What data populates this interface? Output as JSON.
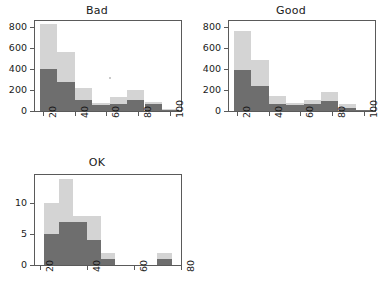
{
  "figure": {
    "background": "#ffffff",
    "colors": {
      "light_series": "#d4d4d4",
      "dark_series": "#6e6e6e",
      "axis": "#5a5a5a",
      "text": "#1a1a1a"
    },
    "layout": "2x2 grid, bottom-right cell empty"
  },
  "chart_data": [
    {
      "type": "bar",
      "title": "Bad",
      "xlabel": "",
      "ylabel": "",
      "xlim": [
        15,
        107
      ],
      "ylim": [
        0,
        860
      ],
      "grid": false,
      "legend": null,
      "xticks": [
        20,
        40,
        60,
        80,
        100
      ],
      "yticks": [
        0,
        200,
        400,
        600,
        800
      ],
      "bin_edges": [
        18,
        29,
        40,
        51,
        62,
        73,
        84,
        95,
        106
      ],
      "series": [
        {
          "name": "light",
          "values": [
            830,
            560,
            220,
            80,
            130,
            205,
            85,
            15
          ]
        },
        {
          "name": "dark",
          "values": [
            405,
            275,
            110,
            55,
            65,
            105,
            70,
            8
          ]
        }
      ],
      "annotations": [
        {
          "type": "dot",
          "x": 62,
          "y": 270
        }
      ]
    },
    {
      "type": "bar",
      "title": "Good",
      "xlabel": "",
      "ylabel": "",
      "xlim": [
        15,
        107
      ],
      "ylim": [
        0,
        860
      ],
      "grid": false,
      "legend": null,
      "xticks": [
        20,
        40,
        60,
        80,
        100
      ],
      "yticks": [
        0,
        200,
        400,
        600,
        800
      ],
      "bin_edges": [
        18,
        29,
        40,
        51,
        62,
        73,
        84,
        95,
        106
      ],
      "series": [
        {
          "name": "light",
          "values": [
            760,
            490,
            140,
            80,
            110,
            185,
            65,
            10
          ]
        },
        {
          "name": "dark",
          "values": [
            390,
            240,
            70,
            55,
            65,
            95,
            30,
            5
          ]
        }
      ],
      "annotations": []
    },
    {
      "type": "bar",
      "title": "OK",
      "xlabel": "",
      "ylabel": "",
      "xlim": [
        18,
        80
      ],
      "ylim": [
        0,
        14.6
      ],
      "grid": false,
      "legend": null,
      "xticks": [
        20,
        40,
        60,
        80
      ],
      "yticks": [
        0,
        5,
        10
      ],
      "bin_edges": [
        22,
        28,
        34,
        40,
        46,
        52,
        58,
        64,
        70,
        76
      ],
      "series": [
        {
          "name": "light",
          "values": [
            10,
            14,
            8,
            8,
            2,
            0,
            0,
            0,
            2
          ]
        },
        {
          "name": "dark",
          "values": [
            5,
            7,
            7,
            4,
            1,
            0,
            0,
            0,
            1
          ]
        }
      ],
      "annotations": []
    }
  ]
}
